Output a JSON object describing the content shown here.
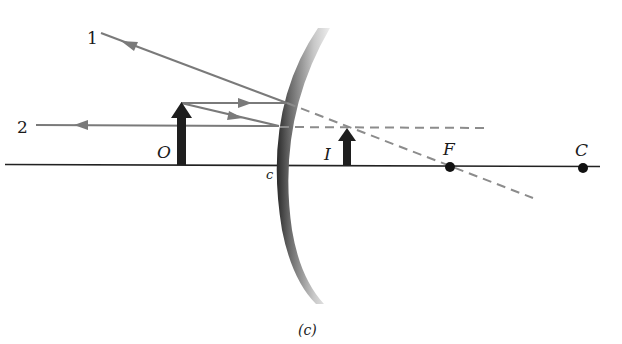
{
  "diagram": {
    "caption": "(c)",
    "ray_labels": {
      "ray1": "1",
      "ray2": "2"
    },
    "point_labels": {
      "object": "O",
      "image": "I",
      "focal_point": "F",
      "center_of_curvature": "C",
      "vertex": "c"
    },
    "colors": {
      "ray": "#7a7a7a",
      "dashed": "#8c8c8c",
      "axis": "#222222",
      "arrow": "#1e1e1e",
      "mirror_dark": "#2a2a2a",
      "mirror_light": "#e6e6e6"
    }
  }
}
